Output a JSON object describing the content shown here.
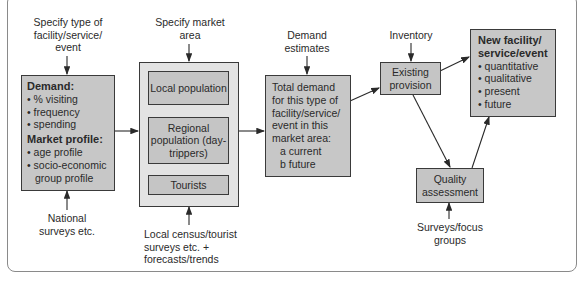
{
  "inputs": {
    "facility_type": "Specify type of facility/service/ event",
    "market_area": "Specify market area",
    "demand_estimates": "Demand estimates",
    "inventory": "Inventory",
    "national_surveys": "National surveys etc.",
    "local_census": "Local census/tourist surveys etc. + forecasts/trends",
    "surveys_focus": "Surveys/focus groups"
  },
  "demand_box": {
    "heading1": "Demand:",
    "items1": [
      "% visiting",
      "frequency",
      "spending"
    ],
    "heading2": "Market profile:",
    "items2": [
      "age profile",
      "socio-economic group profile"
    ]
  },
  "market_area_box": {
    "local": "Local population",
    "regional": "Regional population (day-trippers)",
    "tourists": "Tourists"
  },
  "total_demand_box": {
    "text": "Total demand for this type of facility/service/ event in this market area:",
    "a": "a current",
    "b": "b future"
  },
  "existing_provision": "Existing provision",
  "quality_assessment": "Quality assessment",
  "new_facility_box": {
    "heading": "New facility/ service/event",
    "items": [
      "quantitative",
      "qualitative",
      "present",
      "future"
    ]
  },
  "colors": {
    "box_fill": "#c7c7c7",
    "outer_fill": "#e3e3e3",
    "border": "#3a3a3a"
  }
}
